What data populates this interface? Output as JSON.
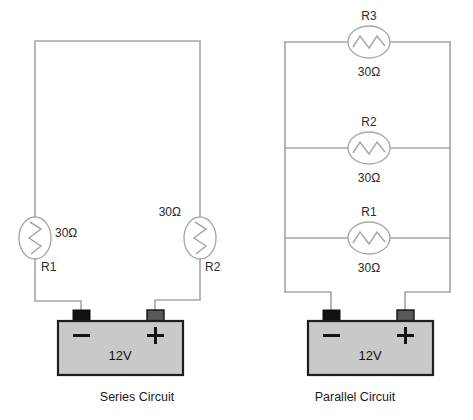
{
  "figure": {
    "title": "",
    "background_color": "#ffffff",
    "wire_color": "#a6a6a6",
    "battery_body_color": "#c9c9c9",
    "battery_border_color": "#1e1e1e",
    "negative_terminal_color": "#111111",
    "positive_terminal_color": "#585858"
  },
  "series_circuit": {
    "caption": "Series Circuit",
    "battery": {
      "voltage_label": "12V",
      "negative_sign": "−",
      "positive_sign": "+"
    },
    "resistors": [
      {
        "name": "R1",
        "value": "30Ω"
      },
      {
        "name": "R2",
        "value": "30Ω"
      }
    ]
  },
  "parallel_circuit": {
    "caption": "Parallel Circuit",
    "battery": {
      "voltage_label": "12V",
      "negative_sign": "−",
      "positive_sign": "+"
    },
    "resistors": [
      {
        "name": "R3",
        "value": "30Ω"
      },
      {
        "name": "R2",
        "value": "30Ω"
      },
      {
        "name": "R1",
        "value": "30Ω"
      }
    ]
  }
}
